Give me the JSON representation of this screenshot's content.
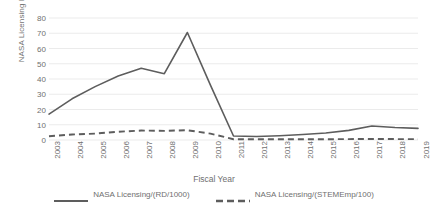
{
  "chart_data": {
    "type": "line",
    "title": "",
    "xlabel": "Fiscal Year",
    "ylabel": "NASA Licensing Metrics",
    "grid": true,
    "legend_position": "bottom",
    "ylim": [
      0,
      80
    ],
    "yticks": [
      0,
      10,
      20,
      30,
      40,
      50,
      60,
      70,
      80
    ],
    "categories": [
      "2003",
      "2004",
      "2005",
      "2006",
      "2007",
      "2008",
      "2009",
      "2010",
      "2011",
      "2012",
      "2013",
      "2014",
      "2015",
      "2016",
      "2017",
      "2018",
      "2019"
    ],
    "series": [
      {
        "name": "NASA Licensing/(RD/1000)",
        "style": "solid",
        "color": "#5d5d5d",
        "values": [
          17.0,
          27.0,
          35.0,
          42.0,
          47.0,
          43.5,
          70.5,
          36.0,
          2.6,
          2.3,
          2.8,
          3.6,
          4.6,
          6.3,
          9.2,
          8.2,
          7.6
        ]
      },
      {
        "name": "NASA Licensing/(STEMEmp/100)",
        "style": "dashed",
        "color": "#5d5d5d",
        "values": [
          2.5,
          3.6,
          4.2,
          5.4,
          6.2,
          6.0,
          6.4,
          4.2,
          0.5,
          0.5,
          0.5,
          0.5,
          0.5,
          0.6,
          0.7,
          0.6,
          0.6
        ]
      }
    ]
  },
  "axis": {
    "y_title": "NASA Licensing Metrics",
    "x_title": "Fiscal Year"
  },
  "legend": {
    "items": [
      {
        "label": "NASA Licensing/(RD/1000)",
        "style": "solid"
      },
      {
        "label": "NASA Licensing/(STEMEmp/100)",
        "style": "dashed"
      }
    ]
  }
}
